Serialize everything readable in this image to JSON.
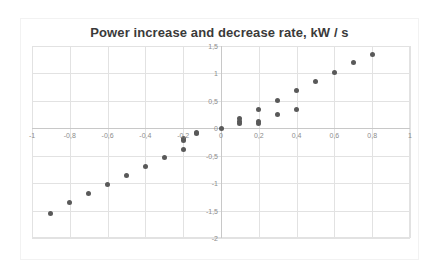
{
  "chart_data": {
    "type": "scatter",
    "title": "Power increase and decrease rate, kW / s",
    "xlabel": "",
    "ylabel": "",
    "xlim": [
      -1,
      1
    ],
    "ylim": [
      -2,
      1.5
    ],
    "xticks": [
      -1,
      -0.8,
      -0.6,
      -0.4,
      -0.2,
      0,
      0.2,
      0.4,
      0.6,
      0.8,
      1
    ],
    "yticks": [
      1.5,
      1,
      0.5,
      0,
      -0.5,
      -1,
      -1.5,
      -2
    ],
    "xtick_labels": [
      "-1",
      "-0,8",
      "-0,6",
      "-0,4",
      "-0,2",
      "0",
      "0,2",
      "0,4",
      "0,6",
      "0,8",
      "1"
    ],
    "ytick_labels": [
      "1,5",
      "1",
      "0,5",
      "0",
      "-0,5",
      "-1",
      "-1,5",
      "-2"
    ],
    "decimal_separator": ",",
    "grid": true,
    "grid_x_step": 0.2,
    "grid_y_step": 0.5,
    "legend": false,
    "marker_color": "#595959",
    "grid_color": "#e2e2e2",
    "axis_color": "#c8c8c8",
    "title_color": "#3a3a3a",
    "tick_color": "#8c8c8c",
    "series": [
      {
        "name": "Power rate",
        "points": [
          [
            -0.9,
            -1.55
          ],
          [
            -0.8,
            -1.35
          ],
          [
            -0.7,
            -1.18
          ],
          [
            -0.6,
            -1.02
          ],
          [
            -0.5,
            -0.86
          ],
          [
            -0.4,
            -0.7
          ],
          [
            -0.3,
            -0.54
          ],
          [
            -0.2,
            -0.38
          ],
          [
            -0.2,
            -0.22
          ],
          [
            -0.2,
            -0.18
          ],
          [
            -0.13,
            -0.1
          ],
          [
            -0.13,
            -0.07
          ],
          [
            0,
            0
          ],
          [
            0.1,
            0.17
          ],
          [
            0.1,
            0.12
          ],
          [
            0.1,
            0.08
          ],
          [
            0.2,
            0.35
          ],
          [
            0.2,
            0.13
          ],
          [
            0.2,
            0.09
          ],
          [
            0.3,
            0.51
          ],
          [
            0.3,
            0.25
          ],
          [
            0.4,
            0.69
          ],
          [
            0.4,
            0.35
          ],
          [
            0.5,
            0.86
          ],
          [
            0.6,
            1.02
          ],
          [
            0.7,
            1.2
          ],
          [
            0.8,
            1.35
          ]
        ]
      }
    ]
  }
}
